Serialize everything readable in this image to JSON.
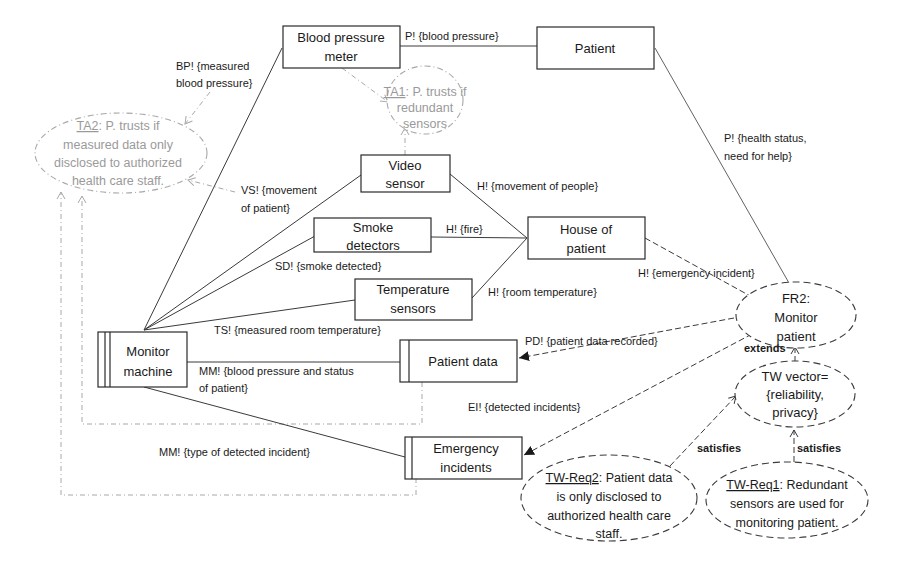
{
  "diagram": {
    "domains": {
      "blood_pressure_meter": [
        "Blood pressure",
        "meter"
      ],
      "patient": [
        "Patient"
      ],
      "video_sensor": [
        "Video",
        "sensor"
      ],
      "smoke_detectors": [
        "Smoke",
        "detectors"
      ],
      "house_of_patient": [
        "House of",
        "patient"
      ],
      "temperature_sensors": [
        "Temperature",
        "sensors"
      ],
      "monitor_machine": [
        "Monitor",
        "machine"
      ],
      "patient_data": [
        "Patient data"
      ],
      "emergency_incidents": [
        "Emergency",
        "incidents"
      ]
    },
    "interfaces": {
      "bpm_patient": "P! {blood pressure}",
      "bpm_ta2": [
        "BP! {measured",
        "blood pressure}"
      ],
      "patient_fr2": [
        "P! {health status,",
        "need for help}"
      ],
      "vs_ta2": [
        "VS! {movement",
        "of patient}"
      ],
      "vs_house": "H! {movement of people}",
      "smoke_house": "H! {fire}",
      "smoke_mm": "SD! {smoke detected}",
      "temp_house": "H! {room temperature}",
      "house_fr2": "H! {emergency incident}",
      "temp_mm": "TS! {measured room temperature}",
      "fr2_patient_data": "PD! {patient data recorded}",
      "mm_patient_data": [
        "MM! {blood pressure and status",
        "of patient}"
      ],
      "fr2_emergency": "EI! {detected incidents}",
      "mm_emergency": "MM! {type of  detected incident}"
    },
    "trust_assumptions": {
      "ta1": {
        "id": "TA1",
        "lines": [
          ": P. trusts if",
          "redundant",
          "sensors"
        ]
      },
      "ta2": {
        "id": "TA2",
        "lines": [
          ": P. trusts if",
          "measured data only",
          "disclosed to authorized",
          "health care staff."
        ]
      }
    },
    "requirements": {
      "fr2": [
        "FR2:",
        "Monitor",
        "patient"
      ],
      "tw_vector": [
        "TW vector=",
        "{reliability,",
        "privacy}"
      ],
      "tw_req2": {
        "id": "TW-Req2",
        "lines": [
          ": Patient data",
          "is only disclosed to",
          "authorized health care",
          "staff."
        ]
      },
      "tw_req1": {
        "id": "TW-Req1",
        "lines": [
          ": Redundant",
          "sensors are used for",
          "monitoring patient."
        ]
      }
    },
    "relations": {
      "extends": "extends",
      "satisfies_req2": "satisfies",
      "satisfies_req1": "satisfies"
    }
  }
}
